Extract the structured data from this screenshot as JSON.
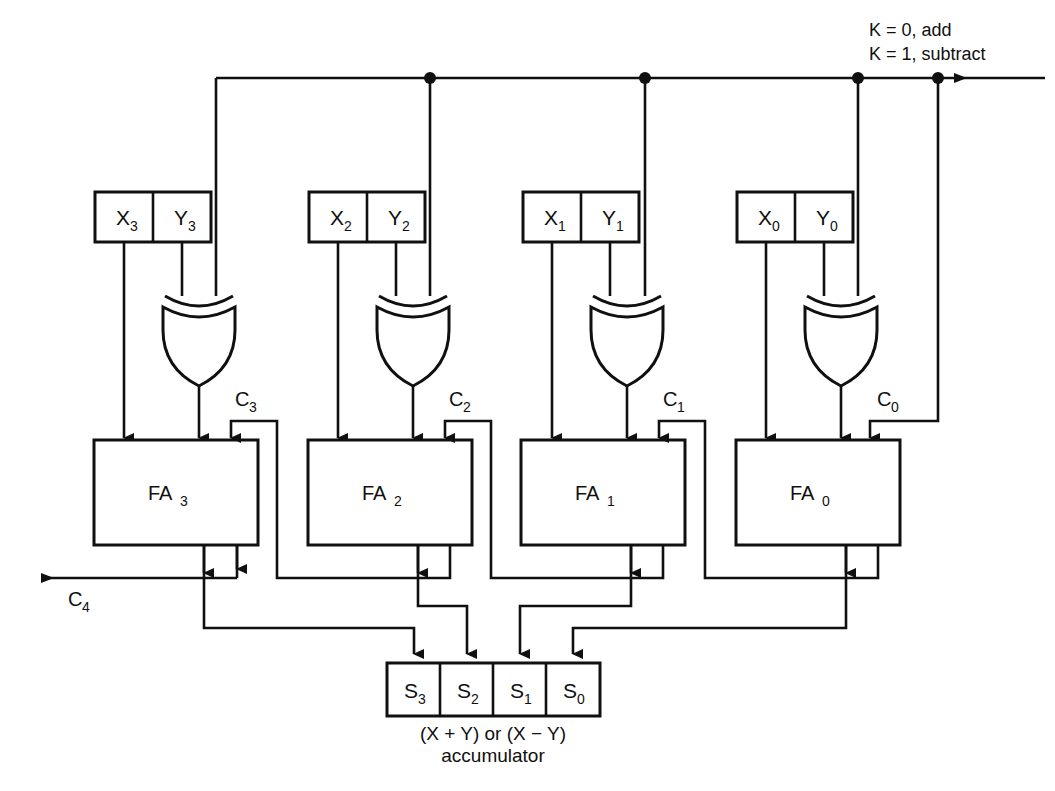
{
  "figure": {
    "caption_line1": "(X + Y) or (X − Y)",
    "caption_line2": "accumulator",
    "figure_note": ""
  },
  "control": {
    "line1": "K = 0, add",
    "line2": "K = 1, subtract",
    "bus_name": "K control bus"
  },
  "registers": [
    {
      "id": "r3",
      "x_label": "X",
      "x_sub": "3",
      "y_label": "Y",
      "y_sub": "3"
    },
    {
      "id": "r2",
      "x_label": "X",
      "x_sub": "2",
      "y_label": "Y",
      "y_sub": "2"
    },
    {
      "id": "r1",
      "x_label": "X",
      "x_sub": "1",
      "y_label": "Y",
      "y_sub": "1"
    },
    {
      "id": "r0",
      "x_label": "X",
      "x_sub": "0",
      "y_label": "Y",
      "y_sub": "0"
    }
  ],
  "gates": [
    {
      "id": "xor3",
      "type": "xor",
      "label": "XOR"
    },
    {
      "id": "xor2",
      "type": "xor",
      "label": "XOR"
    },
    {
      "id": "xor1",
      "type": "xor",
      "label": "XOR"
    },
    {
      "id": "xor0",
      "type": "xor",
      "label": "XOR"
    }
  ],
  "adders": [
    {
      "id": "fa3",
      "label": "FA",
      "sub": "3"
    },
    {
      "id": "fa2",
      "label": "FA",
      "sub": "2"
    },
    {
      "id": "fa1",
      "label": "FA",
      "sub": "1"
    },
    {
      "id": "fa0",
      "label": "FA",
      "sub": "0"
    }
  ],
  "carries": [
    {
      "id": "c4",
      "label": "C",
      "sub": "4",
      "role": "output"
    },
    {
      "id": "c3",
      "label": "C",
      "sub": "3",
      "role": "internal"
    },
    {
      "id": "c2",
      "label": "C",
      "sub": "2",
      "role": "internal"
    },
    {
      "id": "c1",
      "label": "C",
      "sub": "1",
      "role": "internal"
    },
    {
      "id": "c0",
      "label": "C",
      "sub": "0",
      "role": "input"
    }
  ],
  "accumulator": {
    "cells": [
      {
        "label": "S",
        "sub": "3"
      },
      {
        "label": "S",
        "sub": "2"
      },
      {
        "label": "S",
        "sub": "1"
      },
      {
        "label": "S",
        "sub": "0"
      }
    ]
  },
  "colors": {
    "ink": "#101010",
    "paper": "#ffffff"
  }
}
